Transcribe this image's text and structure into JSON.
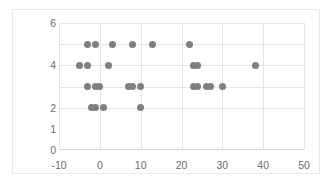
{
  "chart_data": {
    "type": "scatter",
    "title": "",
    "xlabel": "",
    "ylabel": "",
    "xlim": [
      -10,
      50
    ],
    "ylim": [
      0,
      6
    ],
    "xticks": [
      -10,
      0,
      10,
      20,
      30,
      40,
      50
    ],
    "xticklabels": [
      "-10",
      "0",
      "10",
      "20",
      "30",
      "40",
      "50"
    ],
    "yticks": [
      0,
      1,
      2,
      4,
      6
    ],
    "yticklabels": [
      "0",
      "1",
      "2",
      "4",
      "6"
    ],
    "gridlines_x": [
      -10,
      0,
      10,
      20,
      30,
      40,
      50
    ],
    "gridlines_y": [
      2,
      3,
      4,
      5,
      6
    ],
    "grid": true,
    "legend": false,
    "marker_color": "#7f7f7f",
    "marker_size": 7,
    "points": [
      {
        "x": -3,
        "y": 5
      },
      {
        "x": -1,
        "y": 5
      },
      {
        "x": 3,
        "y": 5
      },
      {
        "x": 8,
        "y": 5
      },
      {
        "x": 13,
        "y": 5
      },
      {
        "x": 22,
        "y": 5
      },
      {
        "x": -5,
        "y": 4
      },
      {
        "x": -3,
        "y": 4
      },
      {
        "x": 2,
        "y": 4
      },
      {
        "x": 23,
        "y": 4
      },
      {
        "x": 24,
        "y": 4
      },
      {
        "x": 38,
        "y": 4
      },
      {
        "x": -3,
        "y": 3
      },
      {
        "x": -1,
        "y": 3
      },
      {
        "x": 0,
        "y": 3
      },
      {
        "x": 7,
        "y": 3
      },
      {
        "x": 8,
        "y": 3
      },
      {
        "x": 10,
        "y": 3
      },
      {
        "x": 23,
        "y": 3
      },
      {
        "x": 24,
        "y": 3
      },
      {
        "x": 26,
        "y": 3
      },
      {
        "x": 27,
        "y": 3
      },
      {
        "x": 30,
        "y": 3
      },
      {
        "x": -2,
        "y": 2
      },
      {
        "x": -1,
        "y": 2
      },
      {
        "x": 1,
        "y": 2
      },
      {
        "x": 10,
        "y": 2
      }
    ]
  }
}
